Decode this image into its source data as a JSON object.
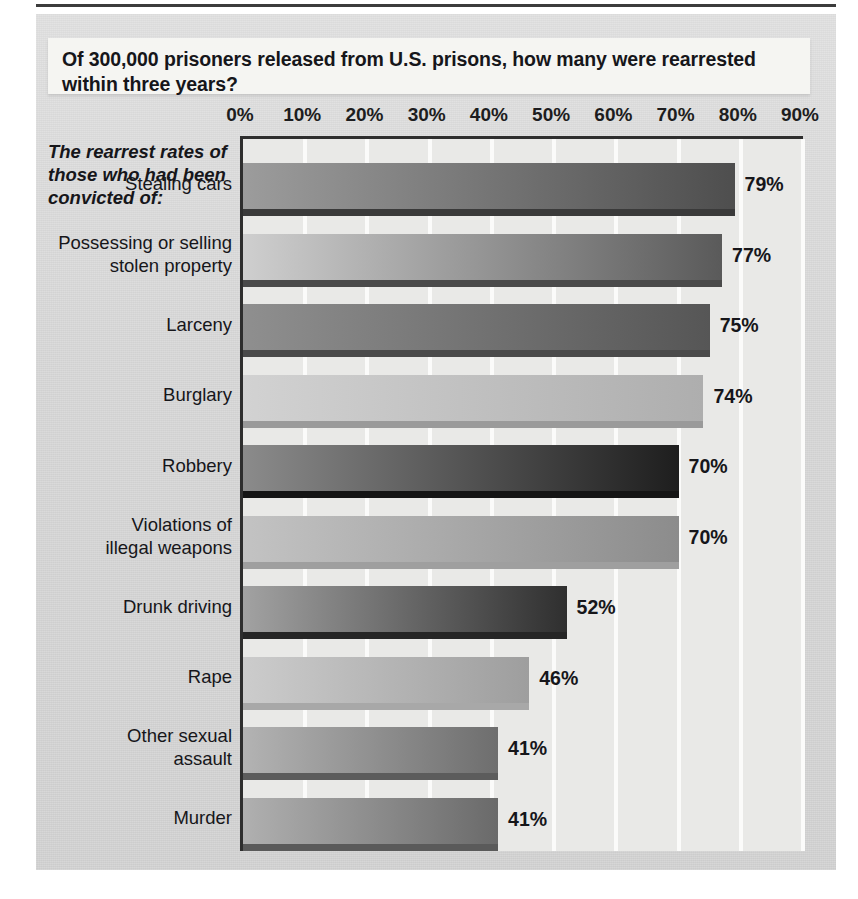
{
  "chart_data": {
    "type": "bar",
    "orientation": "horizontal",
    "title": "Of 300,000 prisoners released from U.S. prisons, how many were rearrested within three years?",
    "axis_header": "The rearrest rates of those who had been convicted of:",
    "xlabel": "",
    "ylabel": "",
    "xlim": [
      0,
      90
    ],
    "xticks": [
      0,
      10,
      20,
      30,
      40,
      50,
      60,
      70,
      80,
      90
    ],
    "xtick_labels": [
      "0%",
      "10%",
      "20%",
      "30%",
      "40%",
      "50%",
      "60%",
      "70%",
      "80%",
      "90%"
    ],
    "grid": true,
    "grid_color": "#fbfbfa",
    "legend": null,
    "categories": [
      "Stealing cars",
      "Possessing or selling stolen property",
      "Larceny",
      "Burglary",
      "Robbery",
      "Violations of illegal weapons",
      "Drunk driving",
      "Rape",
      "Other sexual assault",
      "Murder"
    ],
    "values": [
      79,
      77,
      75,
      74,
      70,
      70,
      52,
      46,
      41,
      41
    ],
    "data_labels": [
      "79%",
      "77%",
      "75%",
      "74%",
      "70%",
      "70%",
      "52%",
      "46%",
      "41%",
      "41%"
    ],
    "bar_colors_start": [
      "#9c9c9c",
      "#cfcfcf",
      "#8f8f8f",
      "#d2d2d2",
      "#8b8b8b",
      "#c3c3c3",
      "#a2a2a2",
      "#cccccc",
      "#b3b3b3",
      "#b0b0b0"
    ],
    "bar_colors_end": [
      "#4e4e4e",
      "#5a5a5a",
      "#565656",
      "#aeaeae",
      "#1e1e1e",
      "#8c8c8c",
      "#2f2f2f",
      "#9e9e9e",
      "#6e6e6e",
      "#6a6a6a"
    ],
    "bar_shadow_colors": [
      "#3a3a3a",
      "#4a4a4a",
      "#4a4a4a",
      "#9a9a9a",
      "#151515",
      "#9f9f9f",
      "#262626",
      "#a8a8a8",
      "#5c5c5c",
      "#5a5a5a"
    ],
    "plot_background": "#e9e9e7",
    "panel_background": "#d6d6d6"
  },
  "categories_wrapped": [
    [
      "Stealing cars"
    ],
    [
      "Possessing or selling",
      "stolen property"
    ],
    [
      "Larceny"
    ],
    [
      "Burglary"
    ],
    [
      "Robbery"
    ],
    [
      "Violations of",
      "illegal weapons"
    ],
    [
      "Drunk driving"
    ],
    [
      "Rape"
    ],
    [
      "Other sexual",
      "assault"
    ],
    [
      "Murder"
    ]
  ]
}
